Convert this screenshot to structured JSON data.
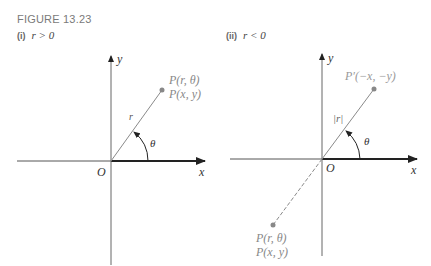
{
  "figure": {
    "title": "FIGURE 13.23"
  },
  "panels": [
    {
      "id": "i",
      "number": "(i)",
      "condition": "r > 0",
      "axis_x_label": "x",
      "axis_y_label": "y",
      "origin_label": "O",
      "radius_label": "r",
      "angle_label": "θ",
      "point_label_polar": "P(r, θ)",
      "point_label_rect": "P(x, y)"
    },
    {
      "id": "ii",
      "number": "(ii)",
      "condition": "r < 0",
      "axis_x_label": "x",
      "axis_y_label": "y",
      "origin_label": "O",
      "radius_label": "|r|",
      "angle_label": "θ",
      "reflected_point_label": "P′(−x, −y)",
      "point_label_polar": "P(r, θ)",
      "point_label_rect": "P(x, y)"
    }
  ],
  "colors": {
    "axis": "#444444",
    "ray": "#8a8a8a",
    "point": "#888888",
    "label_gray": "#888888",
    "label_dark": "#333333"
  }
}
